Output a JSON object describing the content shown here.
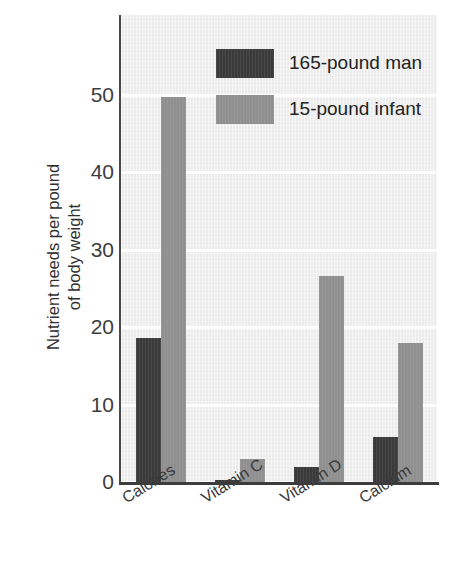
{
  "chart_data": {
    "type": "bar",
    "title": "",
    "subtitle": "",
    "xlabel": "",
    "ylabel": "Nutrient needs per pound of body weight",
    "ylabel_lines": [
      "Nutrient needs per pound",
      "of body weight"
    ],
    "categories": [
      "Calories",
      "Vitamin C",
      "Vitamin D",
      "Calcium"
    ],
    "series": [
      {
        "name": "165-pound man",
        "color": "#3a3a3a",
        "values": [
          18.6,
          0.2,
          2.0,
          5.8
        ]
      },
      {
        "name": "15-pound infant",
        "color": "#8f8f8f",
        "values": [
          49.8,
          3.0,
          26.6,
          17.9
        ]
      }
    ],
    "ylim": [
      0,
      57
    ],
    "yticks": [
      0,
      10,
      20,
      30,
      40,
      50
    ],
    "ytick_labels": [
      "0",
      "10",
      "20",
      "30",
      "40",
      "50"
    ],
    "grid": true,
    "grid_color": "#fdfdfd",
    "plot_background": "#ebebeb",
    "legend_position": "top-right"
  },
  "legend": {
    "entries": [
      {
        "label": "165-pound man",
        "color": "#3a3a3a"
      },
      {
        "label": "15-pound infant",
        "color": "#8f8f8f"
      }
    ]
  }
}
